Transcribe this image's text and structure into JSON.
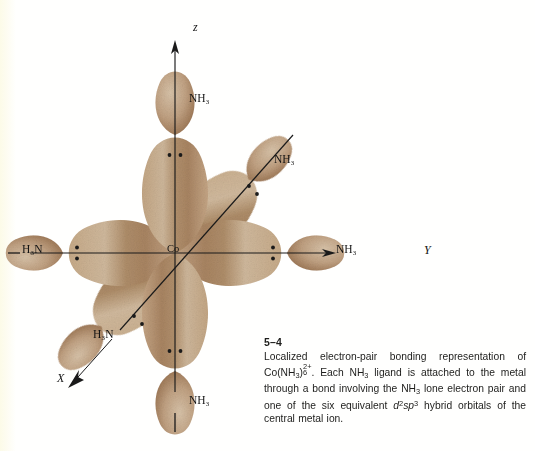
{
  "figure": {
    "number": "5–4",
    "caption_lines": [
      "Localized electron-pair bonding representation of",
      "Co(NH₃)₆²⁺. Each NH₃ ligand is attached to the",
      "metal through a bond involving the NH₃ lone",
      "electron pair and one of the six equivalent d²sp³",
      "hybrid orbitals of the central metal ion."
    ],
    "caption_plain": "Localized electron-pair bonding representation of Co(NH3)6 2+. Each NH3 ligand is attached to the metal through a bond involving the NH3 lone electron pair and one of the six equivalent d2sp3 hybrid orbitals of the central metal ion.",
    "caption_segments": {
      "s1": "Localized electron-pair bonding representation of ",
      "formula_lead": "Co(NH",
      "formula_sub1": "3",
      "formula_close": ")",
      "formula_count": "6",
      "formula_charge": "2+",
      "s2": ". Each NH",
      "s3": " ligand is attached to the metal through a bond involving the NH",
      "s4": " lone electron pair and one of the six equivalent ",
      "orb_d": "d",
      "orb_d_sup": "2",
      "orb_sp": "sp",
      "orb_sp_sup": "3",
      "s5": " hybrid orbitals of the central metal ion.",
      "sub3": "3"
    }
  },
  "diagram": {
    "center_atom": "Co",
    "axes": [
      {
        "name": "z-axis",
        "letter": "z",
        "direction": "up"
      },
      {
        "name": "y-axis",
        "letter": "Y",
        "direction": "right"
      },
      {
        "name": "x-axis",
        "letter": "X",
        "direction": "lower-left"
      }
    ],
    "ligand_labels": [
      {
        "id": "ligand-top",
        "text": "NH₃",
        "orientation": "up"
      },
      {
        "id": "ligand-bottom",
        "text": "NH₃",
        "orientation": "down"
      },
      {
        "id": "ligand-right",
        "text": "NH₃",
        "orientation": "right"
      },
      {
        "id": "ligand-left",
        "text": "H₃N",
        "orientation": "left"
      },
      {
        "id": "ligand-upper-right",
        "text": "NH₃",
        "orientation": "upper-right"
      },
      {
        "id": "ligand-lower-left",
        "text": "H₃N",
        "orientation": "lower-left"
      }
    ],
    "lone_pair_count_per_ligand": 2,
    "hybrid_orbital_count": 6,
    "colors": {
      "lobe_light": "#cdb496",
      "lobe_mid": "#b9936d",
      "lobe_dark": "#8c6344",
      "axis_line": "#1a1a1a",
      "background": "#fffffd",
      "text": "#141414"
    }
  }
}
